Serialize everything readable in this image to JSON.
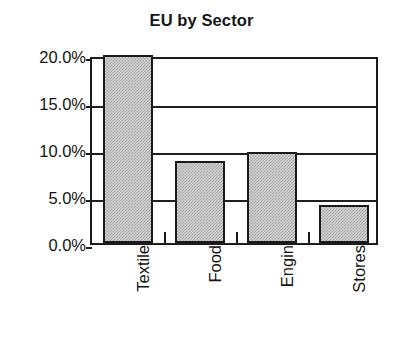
{
  "chart_data": {
    "type": "bar",
    "title": "EU by Sector",
    "xlabel": "",
    "ylabel": "",
    "categories": [
      "Textile",
      "Food",
      "Engin",
      "Stores"
    ],
    "values": [
      20.0,
      8.7,
      9.7,
      4.0
    ],
    "value_labels": [
      "20.0%",
      "8.7%",
      "9.7%",
      "4.0%"
    ],
    "ylim": [
      0,
      20
    ],
    "y_ticks": [
      0,
      5,
      10,
      15,
      20
    ],
    "y_tick_labels": [
      "0.0%",
      "5.0%",
      "10.0%",
      "15.0%",
      "20.0%"
    ],
    "grid": true,
    "legend": false,
    "legend_position": "none",
    "bar_fill_color": "#cfcfcf",
    "bar_border_color": "#1a1a1a",
    "axis_color": "#1c1c1c",
    "background_color": "#ffffff",
    "text_color": "#141414"
  }
}
